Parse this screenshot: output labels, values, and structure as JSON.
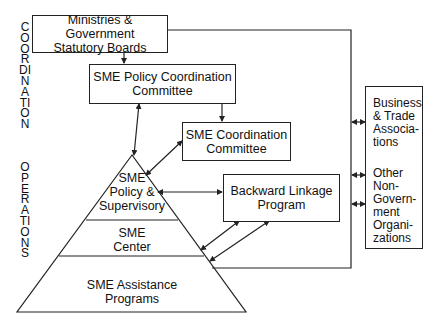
{
  "side_label": {
    "top": "COORDINATION",
    "bottom": "OPERATIONS"
  },
  "boxes": {
    "ministries": [
      "Ministries & Government",
      "Statutory Boards"
    ],
    "policy_coordination": [
      "SME Policy Coordination",
      "Committee"
    ],
    "coordination": [
      "SME Coordination",
      "Committee"
    ],
    "backward_linkage": [
      "Backward Linkage",
      "Program"
    ]
  },
  "pyramid": {
    "tiers": [
      {
        "lines": [
          "SME",
          "Policy &",
          "Supervisory"
        ]
      },
      {
        "lines": [
          "SME",
          "Center"
        ]
      },
      {
        "lines": [
          "SME Assistance",
          "Programs"
        ]
      }
    ]
  },
  "external": {
    "business": [
      "Business",
      "& Trade",
      "Associa-",
      "tions"
    ],
    "ngo": [
      "Other",
      "Non-",
      "Govern-",
      "ment",
      "Organi-",
      "zations"
    ]
  },
  "colors": {
    "line": "#222222",
    "background": "#ffffff"
  }
}
